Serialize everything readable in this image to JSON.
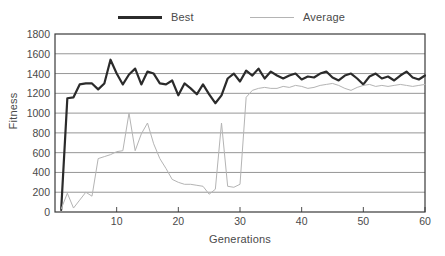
{
  "chart_data": {
    "type": "line",
    "title": "",
    "xlabel": "Generations",
    "ylabel": "Fitness",
    "xlim": [
      0,
      60
    ],
    "ylim": [
      0,
      1800
    ],
    "xticks": [
      10,
      20,
      30,
      40,
      50,
      60
    ],
    "yticks": [
      0,
      200,
      400,
      600,
      800,
      1000,
      1200,
      1400,
      1600,
      1800
    ],
    "grid": "horizontal",
    "legend_position": "top",
    "x": [
      1,
      2,
      3,
      4,
      5,
      6,
      7,
      8,
      9,
      10,
      11,
      12,
      13,
      14,
      15,
      16,
      17,
      18,
      19,
      20,
      21,
      22,
      23,
      24,
      25,
      26,
      27,
      28,
      29,
      30,
      31,
      32,
      33,
      34,
      35,
      36,
      37,
      38,
      39,
      40,
      41,
      42,
      43,
      44,
      45,
      46,
      47,
      48,
      49,
      50,
      51,
      52,
      53,
      54,
      55,
      56,
      57,
      58,
      59,
      60
    ],
    "series": [
      {
        "name": "Best",
        "color": "#2b2b2b",
        "width": 2.2,
        "values": [
          20,
          1150,
          1160,
          1290,
          1300,
          1300,
          1240,
          1300,
          1540,
          1400,
          1290,
          1390,
          1450,
          1290,
          1420,
          1400,
          1300,
          1290,
          1330,
          1180,
          1300,
          1250,
          1190,
          1290,
          1190,
          1100,
          1180,
          1350,
          1400,
          1320,
          1430,
          1380,
          1450,
          1350,
          1420,
          1380,
          1350,
          1380,
          1400,
          1340,
          1370,
          1360,
          1400,
          1420,
          1360,
          1330,
          1380,
          1400,
          1350,
          1290,
          1370,
          1400,
          1350,
          1370,
          1330,
          1380,
          1420,
          1360,
          1340,
          1380
        ]
      },
      {
        "name": "Average",
        "color": "#b4b4b4",
        "width": 1,
        "values": [
          30,
          190,
          40,
          120,
          200,
          160,
          540,
          560,
          580,
          610,
          620,
          1000,
          620,
          790,
          900,
          690,
          540,
          440,
          330,
          300,
          280,
          280,
          270,
          260,
          180,
          230,
          900,
          260,
          250,
          280,
          1160,
          1230,
          1250,
          1260,
          1250,
          1250,
          1270,
          1260,
          1280,
          1270,
          1250,
          1260,
          1280,
          1290,
          1300,
          1280,
          1250,
          1230,
          1260,
          1280,
          1290,
          1270,
          1280,
          1270,
          1280,
          1290,
          1280,
          1270,
          1280,
          1290
        ]
      }
    ]
  },
  "legend": {
    "best_label": "Best",
    "average_label": "Average"
  },
  "axes": {
    "y_title": "Fitness",
    "x_title": "Generations",
    "y_tick_labels": [
      "1800",
      "1600",
      "1400",
      "1200",
      "1000",
      "800",
      "600",
      "400",
      "200",
      "0"
    ],
    "x_tick_labels": [
      "10",
      "20",
      "30",
      "40",
      "50",
      "60"
    ]
  },
  "colors": {
    "best": "#2b2b2b",
    "average": "#b4b4b4",
    "grid": "#8a8a8a",
    "axis": "#3a3a3a",
    "background": "#ffffff"
  }
}
